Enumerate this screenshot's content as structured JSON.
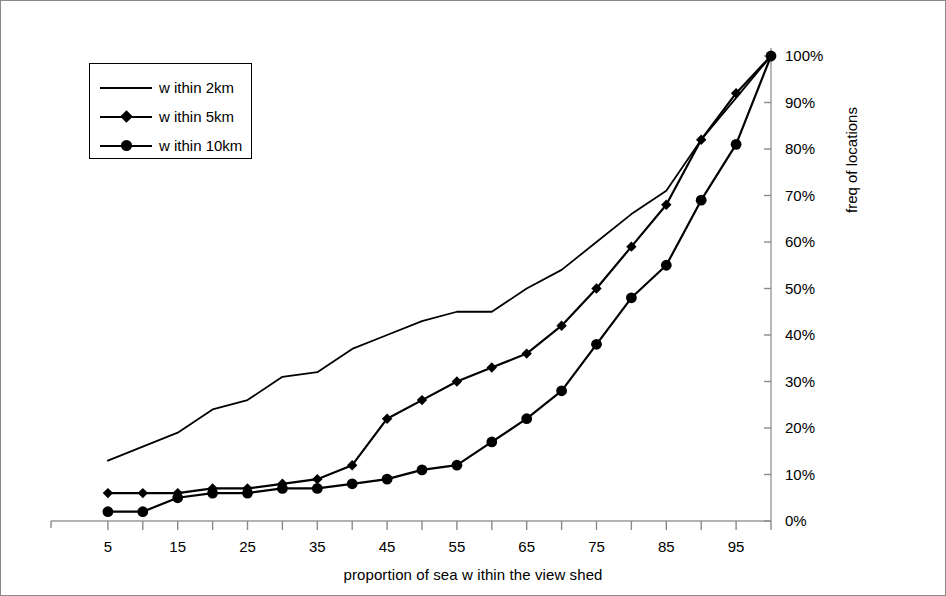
{
  "figure": {
    "background": "#ffffff",
    "line_color": "#000000",
    "border_color": "#8a8a8a"
  },
  "axes": {
    "x_title": "proportion of sea w ithin the view shed",
    "y_title": "freq of locations",
    "x_tick_labels": [
      "5",
      "15",
      "25",
      "35",
      "45",
      "55",
      "65",
      "75",
      "85",
      "95"
    ],
    "x_tick_values": [
      5,
      15,
      25,
      35,
      45,
      55,
      65,
      75,
      85,
      95
    ],
    "x_minor_ticks": [
      10,
      20,
      30,
      40,
      50,
      60,
      70,
      80,
      90,
      100
    ],
    "y_tick_labels": [
      "0%",
      "10%",
      "20%",
      "30%",
      "40%",
      "50%",
      "60%",
      "70%",
      "80%",
      "90%",
      "100%"
    ],
    "y_tick_values": [
      0,
      10,
      20,
      30,
      40,
      50,
      60,
      70,
      80,
      90,
      100
    ],
    "y_axis_side": "right"
  },
  "legend": {
    "position": "top-left",
    "items": [
      {
        "label": "w ithin 2km",
        "marker": "none",
        "marker_icon": "line-icon"
      },
      {
        "label": "w ithin 5km",
        "marker": "diamond",
        "marker_icon": "diamond-marker-icon"
      },
      {
        "label": "w ithin 10km",
        "marker": "circle",
        "marker_icon": "circle-marker-icon"
      }
    ]
  },
  "chart_data": {
    "type": "line",
    "title": "",
    "subtitle": "",
    "xlabel": "proportion of sea w ithin the view shed",
    "ylabel": "freq of locations",
    "xlim": [
      0,
      100
    ],
    "ylim": [
      0,
      100
    ],
    "grid": false,
    "legend_position": "top-left",
    "x": [
      5,
      10,
      15,
      20,
      25,
      30,
      35,
      40,
      45,
      50,
      55,
      60,
      65,
      70,
      75,
      80,
      85,
      90,
      95,
      100
    ],
    "series": [
      {
        "name": "w ithin 2km",
        "marker": "none",
        "values": [
          13,
          16,
          19,
          24,
          26,
          31,
          32,
          37,
          40,
          43,
          45,
          45,
          50,
          54,
          60,
          66,
          71,
          82,
          91,
          100
        ]
      },
      {
        "name": "w ithin 5km",
        "marker": "diamond",
        "values": [
          6,
          6,
          6,
          7,
          7,
          8,
          9,
          12,
          22,
          26,
          30,
          33,
          36,
          42,
          50,
          59,
          68,
          82,
          92,
          100
        ]
      },
      {
        "name": "w ithin 10km",
        "marker": "circle",
        "values": [
          2,
          2,
          5,
          6,
          6,
          7,
          7,
          8,
          9,
          11,
          12,
          17,
          22,
          28,
          38,
          48,
          55,
          69,
          81,
          100
        ]
      }
    ]
  }
}
